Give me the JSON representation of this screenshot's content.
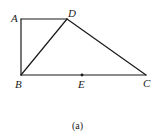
{
  "diagram": {
    "stroke_color": "#1a1a1a",
    "points": {
      "A": {
        "label": "A",
        "x": 21,
        "y": 19
      },
      "D": {
        "label": "D",
        "x": 67,
        "y": 19
      },
      "B": {
        "label": "B",
        "x": 21,
        "y": 75
      },
      "C": {
        "label": "C",
        "x": 146,
        "y": 75
      },
      "E": {
        "label": "E",
        "x": 82,
        "y": 75
      }
    },
    "segments": [
      [
        "A",
        "D"
      ],
      [
        "A",
        "B"
      ],
      [
        "B",
        "D"
      ],
      [
        "D",
        "C"
      ],
      [
        "B",
        "C"
      ]
    ],
    "marked_points": [
      "E"
    ],
    "caption": "(a)"
  }
}
